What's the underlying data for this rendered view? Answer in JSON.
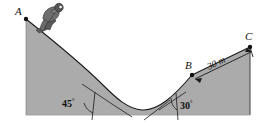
{
  "figure": {
    "background_color": "#ffffff",
    "terrain_fill_color": "#ababab",
    "outline_color": "#1a1a1a",
    "skier_color": "#4a4a4a"
  },
  "points": {
    "a": {
      "label": "A",
      "x": 26,
      "y": 19
    },
    "b": {
      "label": "B",
      "x": 192,
      "y": 75
    },
    "c": {
      "label": "C",
      "x": 250,
      "y": 47
    }
  },
  "angles": {
    "left": {
      "value": "45",
      "degree_symbol": "°"
    },
    "right": {
      "value": "30",
      "degree_symbol": "°"
    }
  },
  "dimension": {
    "distance_label": "30 m",
    "from": "B",
    "to": "C"
  },
  "actors": {
    "skier": {
      "name": "skier",
      "pose": "tuck-crouch"
    }
  }
}
